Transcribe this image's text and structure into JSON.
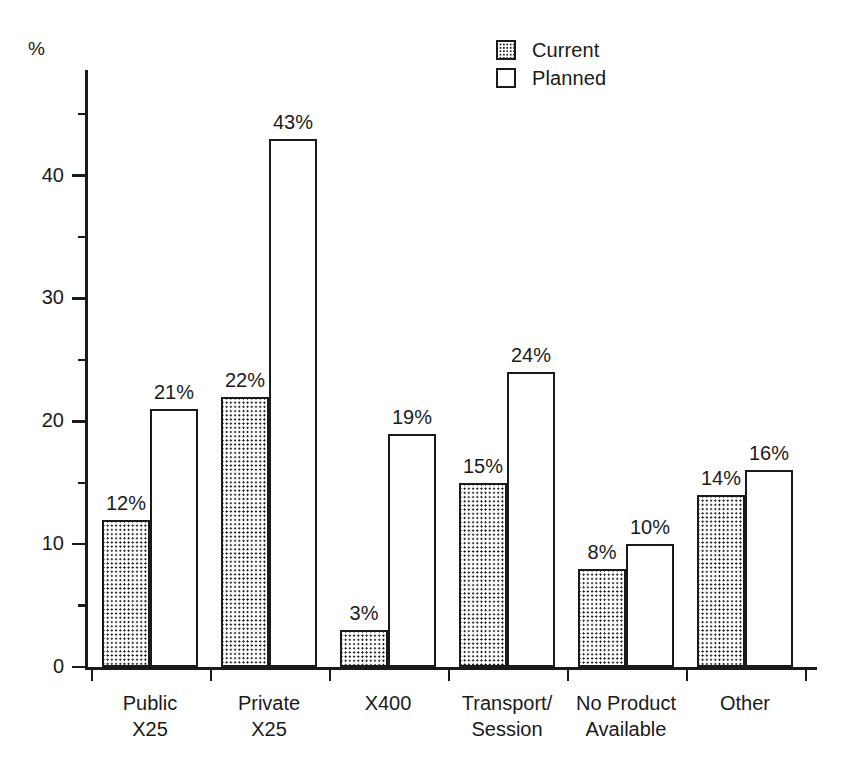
{
  "chart_data": {
    "type": "bar",
    "title": "",
    "subtitle": "",
    "xlabel": "",
    "ylabel": "%",
    "ylim": [
      0,
      46
    ],
    "grid": false,
    "legend_position": "top-right",
    "y_major_ticks": [
      0,
      10,
      20,
      30,
      40
    ],
    "y_minor_ticks": [
      5,
      15,
      25,
      35,
      45
    ],
    "y_tick_labels": [
      "0",
      "10",
      "20",
      "30",
      "40"
    ],
    "categories": [
      "Public\nX25",
      "Private\nX25",
      "X400",
      "Transport/\nSession",
      "No Product\nAvailable",
      "Other"
    ],
    "series": [
      {
        "name": "Current",
        "fill": "stipple",
        "values": [
          12,
          22,
          3,
          15,
          8,
          14
        ],
        "labels": [
          "12%",
          "22%",
          "3%",
          "15%",
          "8%",
          "14%"
        ]
      },
      {
        "name": "Planned",
        "fill": "white",
        "values": [
          21,
          43,
          19,
          24,
          10,
          16
        ],
        "labels": [
          "21%",
          "43%",
          "19%",
          "24%",
          "10%",
          "16%"
        ]
      }
    ],
    "colors": {
      "ink": "#1a1a1a",
      "background": "#ffffff",
      "current_fill": "#ffffff",
      "planned_fill": "#ffffff"
    }
  },
  "legend": {
    "items": [
      {
        "label": "Current",
        "swatch": "stipple-square-icon"
      },
      {
        "label": "Planned",
        "swatch": "empty-square-icon"
      }
    ]
  },
  "axis": {
    "unit_label": "%"
  }
}
